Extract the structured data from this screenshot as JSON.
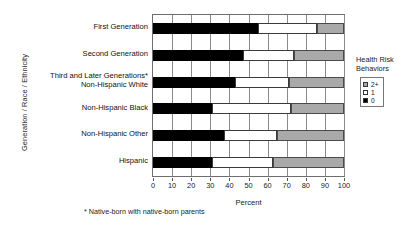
{
  "chart_data": {
    "type": "bar",
    "subtype": "stacked-horizontal-100",
    "title": "",
    "xlabel": "Percent",
    "ylabel": "Generation / Race / Ethnicity",
    "xlim": [
      0,
      100
    ],
    "xticks": [
      0,
      10,
      20,
      30,
      40,
      50,
      60,
      70,
      80,
      90,
      100
    ],
    "xtick_labels": [
      "0",
      "10",
      "20",
      "30",
      "40",
      "50",
      "60",
      "70",
      "80",
      "90",
      "100"
    ],
    "grid": true,
    "legend_position": "right",
    "legend_title": "Health Risk Behaviors",
    "categories": [
      "First Generation",
      "Second Generation",
      "Third and Later Generations*\nNon-Hispanic White",
      "Non-Hispanic Black",
      "Non-Hispanic Other",
      "Hispanic"
    ],
    "category_labels": [
      {
        "line1": "First Generation",
        "line2": ""
      },
      {
        "line1": "Second Generation",
        "line2": ""
      },
      {
        "line1": "Third and Later Generations*",
        "line2": "Non-Hispanic White"
      },
      {
        "line1": "Non-Hispanic Black",
        "line2": ""
      },
      {
        "line1": "Non-Hispanic Other",
        "line2": ""
      },
      {
        "line1": "Hispanic",
        "line2": ""
      }
    ],
    "series": [
      {
        "name": "0",
        "color": "#000000",
        "values": [
          55,
          47,
          43,
          31,
          37,
          31
        ]
      },
      {
        "name": "1",
        "color": "#ffffff",
        "values": [
          31,
          27,
          28,
          41,
          28,
          32
        ]
      },
      {
        "name": "2+",
        "color": "#a9a9a9",
        "values": [
          14,
          26,
          29,
          28,
          35,
          37
        ]
      }
    ],
    "legend_entries": [
      {
        "label": "2+",
        "color": "#a9a9a9"
      },
      {
        "label": "1",
        "color": "#ffffff"
      },
      {
        "label": "0",
        "color": "#000000"
      }
    ],
    "footnote": "* Native-born with native-born parents",
    "colors": {
      "zero": "#000000",
      "one": "#ffffff",
      "twoplus": "#a9a9a9",
      "axis": "#6e6e6e",
      "grid": "#8a8a8a",
      "text": "#1a1a1a"
    }
  }
}
